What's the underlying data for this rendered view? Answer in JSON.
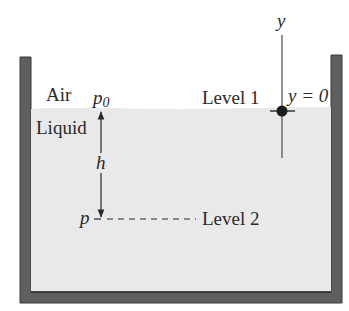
{
  "diagram": {
    "labels": {
      "air": "Air",
      "liquid": "Liquid",
      "p0_base": "p",
      "p0_sub": "0",
      "level1": "Level 1",
      "y_axis": "y",
      "y_zero": "y = 0",
      "h": "h",
      "p": "p",
      "level2": "Level 2"
    },
    "colors": {
      "container_wall": "#5f5f5f",
      "container_outline": "#3a3a3a",
      "liquid": "#e9e9e9",
      "air": "#ffffff",
      "ink": "#2a2a2a"
    }
  }
}
